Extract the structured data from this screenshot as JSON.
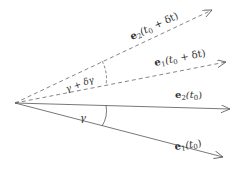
{
  "diagram": {
    "type": "vector-angle",
    "origin": [
      15,
      103
    ],
    "colors": {
      "line": "#555555",
      "text": "#333333",
      "background": "#ffffff"
    },
    "vectors": [
      {
        "id": "e2_t0_dt",
        "style": "dashed",
        "end": [
          212,
          10
        ],
        "label": {
          "base": "e",
          "sub": "2",
          "arg": "(t",
          "argsub": "0",
          "rest": " + δt)"
        }
      },
      {
        "id": "e1_t0_dt",
        "style": "dashed",
        "end": [
          226,
          62
        ],
        "label": {
          "base": "e",
          "sub": "1",
          "arg": "(t",
          "argsub": "0",
          "rest": " + δt)"
        }
      },
      {
        "id": "e2_t0",
        "style": "solid",
        "end": [
          230,
          109
        ],
        "label": {
          "base": "e",
          "sub": "2",
          "arg": "(t",
          "argsub": "0",
          "rest": ")"
        }
      },
      {
        "id": "e1_t0",
        "style": "solid",
        "end": [
          223,
          157
        ],
        "label": {
          "base": "e",
          "sub": "1",
          "arg": "(t",
          "argsub": "0",
          "rest": ")"
        }
      }
    ],
    "angles": [
      {
        "id": "gamma",
        "style": "solid",
        "label": "γ"
      },
      {
        "id": "gamma_plus_dgamma",
        "style": "dashed",
        "label": "γ + δγ"
      }
    ]
  }
}
